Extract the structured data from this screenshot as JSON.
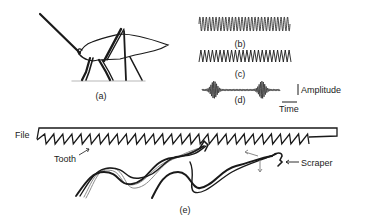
{
  "figure": {
    "panels": {
      "a": {
        "label": "(a)",
        "subject": "insect-side-view"
      },
      "b": {
        "label": "(b)",
        "waveform": "regular-dense-oscillation"
      },
      "c": {
        "label": "(c)",
        "waveform": "regular-sawtooth-oscillation"
      },
      "d": {
        "label": "(d)",
        "waveform": "burst-pulses"
      },
      "e": {
        "label": "(e)",
        "subject": "file-and-scraper-mechanism"
      }
    },
    "axes_legend": {
      "amplitude_label": "Amplitude",
      "time_label": "Time"
    },
    "annotations": {
      "file": "File",
      "tooth": "Tooth",
      "scraper": "Scraper"
    },
    "colors": {
      "ink": "#1a1a1a",
      "grey_trace": "#8a8a8a",
      "ground": "#cfcfcf"
    }
  }
}
